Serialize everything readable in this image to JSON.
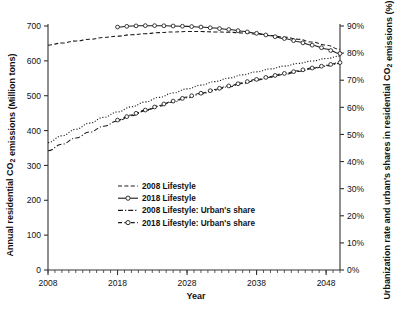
{
  "chart_data": {
    "type": "line",
    "title": "",
    "xlabel": "Year",
    "ylabel": "Annual residential CO₂ emissions (Million tons)",
    "y2label": "Urbanization rate and urban's shares in residential CO₂ emissions (%)",
    "xlim": [
      2008,
      2050
    ],
    "ylim": [
      0,
      700
    ],
    "y2lim": [
      0,
      90
    ],
    "grid": false,
    "legend_position": "center-left",
    "x_tick_labels": [
      "2008",
      "2018",
      "2028",
      "2038",
      "2048"
    ],
    "x_tick_values": [
      2008,
      2018,
      2028,
      2038,
      2048
    ],
    "x_minor_tick_step": 1,
    "y_tick_labels": [
      "0",
      "100",
      "200",
      "300",
      "400",
      "500",
      "600",
      "700"
    ],
    "y_tick_values": [
      0,
      100,
      200,
      300,
      400,
      500,
      600,
      700
    ],
    "y2_tick_labels": [
      "0%",
      "10%",
      "20%",
      "30%",
      "40%",
      "50%",
      "60%",
      "70%",
      "80%",
      "90%"
    ],
    "y2_tick_values": [
      0,
      10,
      20,
      30,
      40,
      50,
      60,
      70,
      80,
      90
    ],
    "series": [
      {
        "name": "2008 Lifestyle",
        "axis": "left",
        "style": "dashed",
        "marker": "none",
        "color": "#1a1a1a",
        "x": [
          2008,
          2010,
          2012,
          2014,
          2016,
          2018,
          2020,
          2022,
          2024,
          2026,
          2028,
          2030,
          2032,
          2034,
          2036,
          2038,
          2040,
          2042,
          2044,
          2046,
          2048,
          2050
        ],
        "values": [
          645,
          651,
          657,
          662,
          667,
          671,
          675,
          678,
          681,
          683,
          684,
          684,
          683,
          682,
          680,
          677,
          673,
          668,
          662,
          654,
          645,
          633
        ]
      },
      {
        "name": "2018 Lifestyle",
        "axis": "left",
        "style": "solid",
        "marker": "open-circle",
        "color": "#1a1a1a",
        "x": [
          2018,
          2020,
          2022,
          2024,
          2026,
          2028,
          2030,
          2032,
          2034,
          2036,
          2038,
          2040,
          2042,
          2044,
          2046,
          2048,
          2050
        ],
        "values": [
          697,
          700,
          701,
          701,
          700,
          699,
          697,
          694,
          690,
          685,
          679,
          672,
          664,
          655,
          645,
          634,
          621
        ]
      },
      {
        "name": "2008 Lifestyle: Urban's share",
        "axis": "right",
        "style": "dash-dot",
        "marker": "none",
        "color": "#1a1a1a",
        "x": [
          2008,
          2010,
          2012,
          2014,
          2016,
          2018,
          2020,
          2022,
          2024,
          2026,
          2028,
          2030,
          2032,
          2034,
          2036,
          2038,
          2040,
          2042,
          2044,
          2046,
          2048,
          2050
        ],
        "values": [
          44.0,
          46.4,
          48.7,
          50.9,
          53.0,
          55.0,
          56.9,
          58.7,
          60.4,
          62.0,
          63.5,
          64.9,
          66.3,
          67.6,
          68.8,
          70.0,
          71.1,
          72.2,
          73.2,
          74.2,
          75.2,
          76.2
        ]
      },
      {
        "name": "2018 Lifestyle: Urban's share",
        "axis": "right",
        "style": "dashed",
        "marker": "open-circle",
        "color": "#1a1a1a",
        "x": [
          2018,
          2020,
          2022,
          2024,
          2026,
          2028,
          2030,
          2032,
          2034,
          2036,
          2038,
          2040,
          2042,
          2044,
          2046,
          2048,
          2050
        ],
        "values": [
          55.3,
          57.2,
          59.0,
          60.7,
          62.3,
          63.8,
          65.2,
          66.6,
          67.9,
          69.1,
          70.3,
          71.4,
          72.5,
          73.5,
          74.5,
          75.5,
          76.5
        ]
      },
      {
        "name": "Urbanization rate",
        "axis": "right",
        "style": "dotted",
        "marker": "none",
        "color": "#1a1a1a",
        "x": [
          2008,
          2010,
          2012,
          2014,
          2016,
          2018,
          2020,
          2022,
          2024,
          2026,
          2028,
          2030,
          2032,
          2034,
          2036,
          2038,
          2040,
          2042,
          2044,
          2046,
          2048,
          2050
        ],
        "values": [
          47.0,
          49.5,
          51.9,
          54.2,
          56.3,
          58.3,
          60.2,
          62.0,
          63.7,
          65.3,
          66.8,
          68.2,
          69.5,
          70.8,
          72.0,
          73.1,
          74.2,
          75.2,
          76.2,
          77.1,
          78.0,
          78.9
        ]
      }
    ],
    "legend": [
      {
        "label": "2008 Lifestyle",
        "style": "dashed",
        "marker": "none"
      },
      {
        "label": "2018 Lifestyle",
        "style": "solid",
        "marker": "open-circle"
      },
      {
        "label": "2008 Lifestyle: Urban's share",
        "style": "dash-dot",
        "marker": "none"
      },
      {
        "label": "2018 Lifestyle: Urban's share",
        "style": "dashed",
        "marker": "open-circle"
      }
    ]
  }
}
